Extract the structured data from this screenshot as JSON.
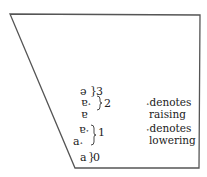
{
  "vowels": [
    {
      "symbol": "ə",
      "group": "3"
    },
    {
      "symbol": "ɐ˔",
      "group": "2"
    },
    {
      "symbol": "ɐ",
      "group": "2"
    },
    {
      "symbol": "ɐ˕",
      "group": "1"
    },
    {
      "symbol": "a˔",
      "group": "1"
    },
    {
      "symbol": "a",
      "group": "0"
    }
  ],
  "groups": {
    "g3": "3",
    "g2": "2",
    "g1": "1",
    "g0": "0"
  },
  "legend": {
    "raising_mark": "˔",
    "raising_l1": "denotes",
    "raising_l2": "raising",
    "lowering_mark": "˕",
    "lowering_l1": "denotes",
    "lowering_l2": "lowering"
  },
  "colors": {
    "line": "#555555",
    "text": "#222222"
  }
}
